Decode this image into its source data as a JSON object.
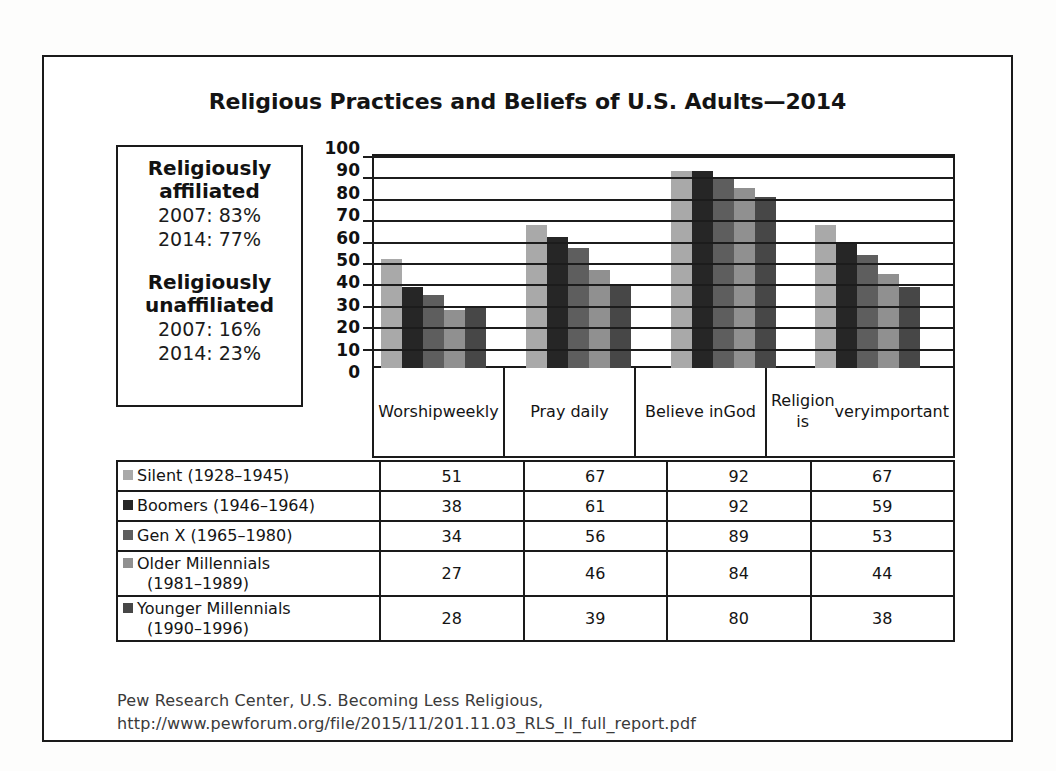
{
  "chart_data": {
    "type": "bar",
    "title": "Religious Practices and Beliefs of U.S. Adults—2014",
    "xlabel": "",
    "ylabel": "",
    "ylim": [
      0,
      100
    ],
    "ytick_step": 10,
    "yticks": [
      100,
      90,
      80,
      70,
      60,
      50,
      40,
      30,
      20,
      10,
      0
    ],
    "grid": true,
    "legend_position": "table-below",
    "categories": [
      "Worship weekly",
      "Pray daily",
      "Believe in God",
      "Religion is very important"
    ],
    "series": [
      {
        "name": "Silent (1928–1945)",
        "color": "#a9a9a9",
        "values": [
          51,
          67,
          92,
          67
        ]
      },
      {
        "name": "Boomers (1946–1964)",
        "color": "#262626",
        "values": [
          38,
          61,
          92,
          59
        ]
      },
      {
        "name": "Gen X (1965–1980)",
        "color": "#5e5e5e",
        "values": [
          34,
          56,
          89,
          53
        ]
      },
      {
        "name": "Older Millennials (1981–1989)",
        "color": "#909090",
        "values": [
          27,
          46,
          84,
          44
        ]
      },
      {
        "name": "Younger Millennials (1990–1996)",
        "color": "#474747",
        "values": [
          28,
          39,
          80,
          38
        ]
      }
    ]
  },
  "info_box": {
    "affiliated_heading_line1": "Religiously",
    "affiliated_heading_line2": "affiliated",
    "affiliated_2007": "2007: 83%",
    "affiliated_2014": "2014: 77%",
    "unaffiliated_heading_line1": "Religiously",
    "unaffiliated_heading_line2": "unaffiliated",
    "unaffiliated_2007": "2007: 16%",
    "unaffiliated_2014": "2014: 23%"
  },
  "category_cells": [
    {
      "line1": "Worship",
      "line2": "weekly",
      "line3": ""
    },
    {
      "line1": "Pray daily",
      "line2": "",
      "line3": ""
    },
    {
      "line1": "Believe in",
      "line2": "God",
      "line3": ""
    },
    {
      "line1": "Religion is",
      "line2": "very",
      "line3": "important"
    }
  ],
  "table_rows": [
    {
      "label_main": "Silent (1928–1945)",
      "label_sub": "",
      "color": "#a9a9a9",
      "values": [
        "51",
        "67",
        "92",
        "67"
      ],
      "tall": false
    },
    {
      "label_main": "Boomers (1946–1964)",
      "label_sub": "",
      "color": "#262626",
      "values": [
        "38",
        "61",
        "92",
        "59"
      ],
      "tall": false
    },
    {
      "label_main": "Gen X (1965–1980)",
      "label_sub": "",
      "color": "#5e5e5e",
      "values": [
        "34",
        "56",
        "89",
        "53"
      ],
      "tall": false
    },
    {
      "label_main": "Older Millennials",
      "label_sub": "(1981–1989)",
      "color": "#909090",
      "values": [
        "27",
        "46",
        "84",
        "44"
      ],
      "tall": true
    },
    {
      "label_main": "Younger Millennials",
      "label_sub": "(1990–1996)",
      "color": "#474747",
      "values": [
        "28",
        "39",
        "80",
        "38"
      ],
      "tall": true
    }
  ],
  "source": {
    "line1": "Pew Research Center, U.S. Becoming Less Religious,",
    "line2": "http://www.pewforum.org/file/2015/11/201.11.03_RLS_II_full_report.pdf"
  }
}
